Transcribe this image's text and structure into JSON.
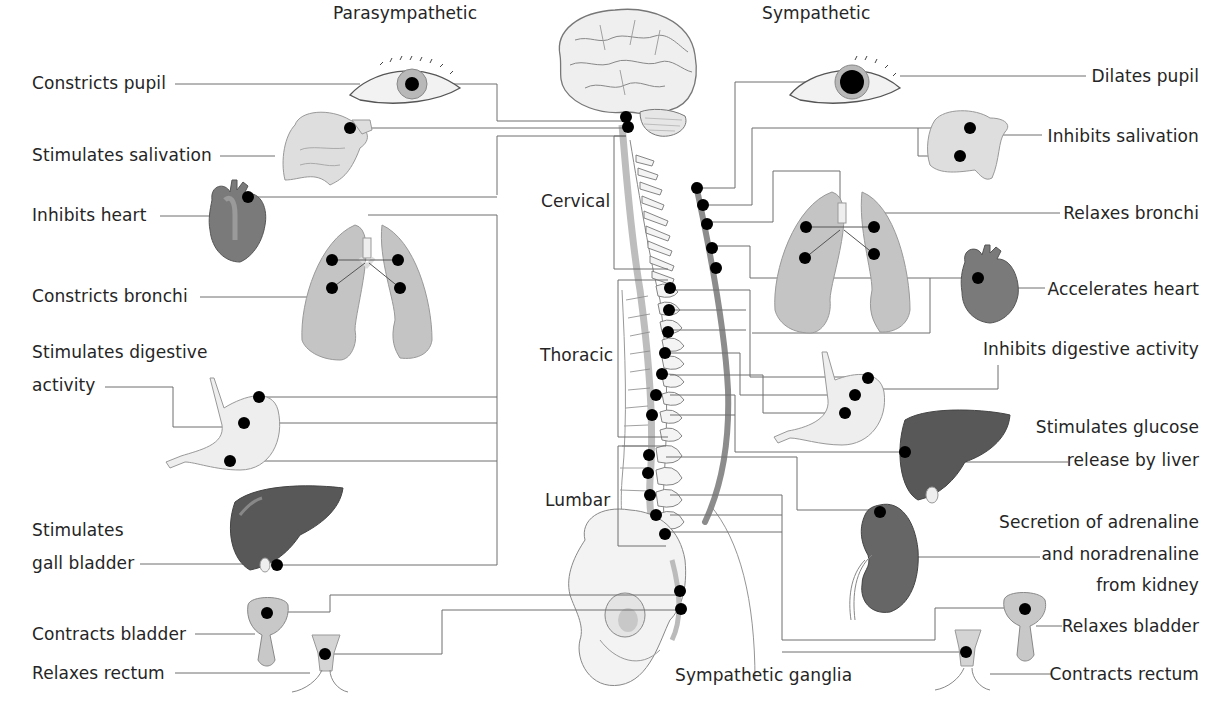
{
  "diagram": {
    "titles": {
      "parasympathetic": "Parasympathetic",
      "sympathetic": "Sympathetic"
    },
    "spine_regions": {
      "cervical": "Cervical",
      "thoracic": "Thoracic",
      "lumbar": "Lumbar",
      "ganglia": "Sympathetic ganglia"
    },
    "parasympathetic_effects": [
      {
        "organ": "eye",
        "label": "Constricts pupil"
      },
      {
        "organ": "salivary-glands",
        "label": "Stimulates salivation"
      },
      {
        "organ": "heart",
        "label": "Inhibits heart"
      },
      {
        "organ": "lungs",
        "label": "Constricts bronchi"
      },
      {
        "organ": "stomach",
        "label_line1": "Stimulates digestive",
        "label_line2": "activity"
      },
      {
        "organ": "liver",
        "label_line1": "Stimulates",
        "label_line2": "gall bladder"
      },
      {
        "organ": "bladder",
        "label": "Contracts bladder"
      },
      {
        "organ": "rectum",
        "label": "Relaxes rectum"
      }
    ],
    "sympathetic_effects": [
      {
        "organ": "eye",
        "label": "Dilates pupil"
      },
      {
        "organ": "salivary-glands",
        "label": "Inhibits salivation"
      },
      {
        "organ": "lungs",
        "label": "Relaxes bronchi"
      },
      {
        "organ": "heart",
        "label": "Accelerates heart"
      },
      {
        "organ": "stomach",
        "label": "Inhibits digestive activity"
      },
      {
        "organ": "liver",
        "label_line1": "Stimulates glucose",
        "label_line2": "release by liver"
      },
      {
        "organ": "kidney",
        "label_line1": "Secretion of adrenaline",
        "label_line2": "and noradrenaline",
        "label_line3": "from kidney"
      },
      {
        "organ": "bladder",
        "label": "Relaxes bladder"
      },
      {
        "organ": "rectum",
        "label": "Contracts rectum"
      }
    ],
    "colors": {
      "line": "#6e6e6e",
      "node": "#000000",
      "organ_light": "#d9d9d9",
      "organ_mid": "#a8a8a8",
      "organ_dark": "#5a5a5a",
      "ganglia_chain": "#8c8c8c"
    }
  }
}
